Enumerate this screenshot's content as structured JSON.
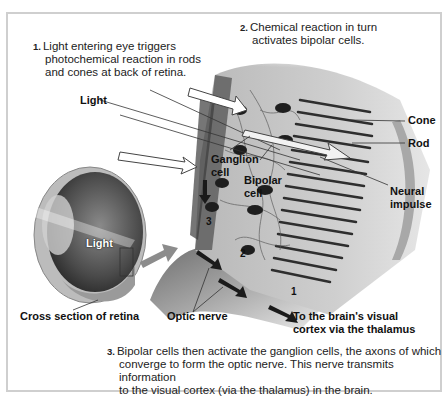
{
  "figure": {
    "steps": [
      {
        "number": "1.",
        "lines": [
          "Light entering eye triggers",
          "photochemical reaction in rods",
          "and cones at back of retina."
        ]
      },
      {
        "number": "2.",
        "lines": [
          "Chemical reaction in turn",
          "activates bipolar cells."
        ]
      },
      {
        "number": "3.",
        "lines": [
          "Bipolar cells then activate the ganglion cells, the axons of which",
          "converge to form the optic nerve. This nerve transmits information",
          "to the visual cortex (via the thalamus) in the brain."
        ]
      }
    ],
    "labels": {
      "light_top": "Light",
      "light_eye": "Light",
      "cone": "Cone",
      "rod": "Rod",
      "neural_impulse_1": "Neural",
      "neural_impulse_2": "impulse",
      "ganglion_1": "Ganglion",
      "ganglion_2": "cell",
      "bipolar_1": "Bipolar",
      "bipolar_2": "cell",
      "cross_section": "Cross section of retina",
      "optic_nerve": "Optic nerve",
      "brain_1": "To the brain's visual",
      "brain_2": "cortex via the thalamus"
    },
    "layer_numbers": {
      "n1": "1",
      "n2": "2",
      "n3": "3"
    },
    "colors": {
      "frame": "#cfcfcf",
      "text": "#222222",
      "illustration_dark": "#3a3a3a",
      "illustration_mid": "#9a9a9a",
      "illustration_light": "#d8d8d8"
    }
  }
}
